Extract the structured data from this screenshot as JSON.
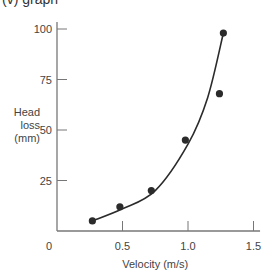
{
  "caption": "(v) graph",
  "chart_data": {
    "type": "scatter",
    "title": "",
    "xlabel": "Velocity (m/s)",
    "ylabel": [
      "Head",
      "loss",
      "(mm)"
    ],
    "xlim": [
      0,
      1.5
    ],
    "ylim": [
      0,
      100
    ],
    "x_ticks": [
      {
        "value": 0,
        "label": "0"
      },
      {
        "value": 0.5,
        "label": "0.5"
      },
      {
        "value": 1.0,
        "label": "1.0"
      },
      {
        "value": 1.5,
        "label": "1.5"
      }
    ],
    "y_ticks": [
      {
        "value": 25,
        "label": "25"
      },
      {
        "value": 50,
        "label": "50"
      },
      {
        "value": 75,
        "label": "75"
      },
      {
        "value": 100,
        "label": "100"
      }
    ],
    "grid": false,
    "series": [
      {
        "name": "Measured",
        "marker": "filled-circle",
        "x": [
          0.27,
          0.48,
          0.72,
          0.98,
          1.24,
          1.27
        ],
        "y": [
          5,
          12,
          20,
          45,
          68,
          98
        ]
      },
      {
        "name": "Fitted curve",
        "marker": "line",
        "x": [
          0.27,
          0.5,
          0.75,
          1.0,
          1.15,
          1.27
        ],
        "y": [
          5,
          11,
          20,
          43,
          66,
          98
        ]
      }
    ],
    "colors": {
      "ink": "#2b2b2b",
      "axis": "#777777"
    }
  }
}
